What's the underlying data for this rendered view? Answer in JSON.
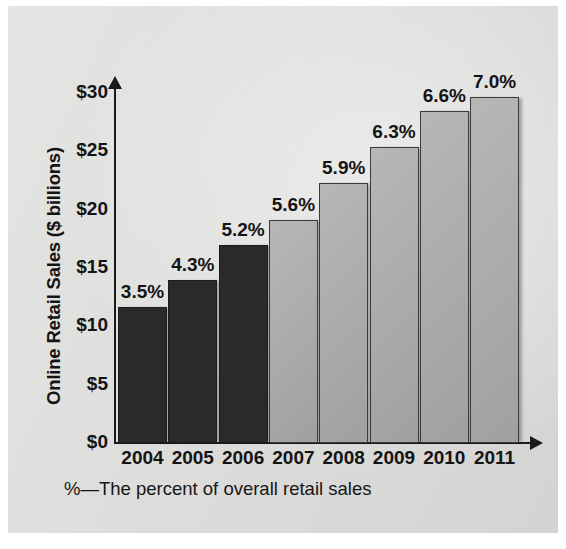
{
  "chart_data": {
    "type": "bar",
    "title": "",
    "xlabel": "",
    "ylabel": "Online Retail Sales ($ billions)",
    "categories": [
      "2004",
      "2005",
      "2006",
      "2007",
      "2008",
      "2009",
      "2010",
      "2011"
    ],
    "values": [
      11.7,
      14.0,
      17.0,
      19.1,
      22.3,
      25.4,
      28.5,
      29.7
    ],
    "point_labels": [
      "3.5%",
      "4.3%",
      "5.2%",
      "5.6%",
      "5.9%",
      "6.3%",
      "6.6%",
      "7.0%"
    ],
    "series": [
      {
        "name": "Online Retail Sales ($ billions)",
        "values": [
          11.7,
          14.0,
          17.0,
          19.1,
          22.3,
          25.4,
          28.5,
          29.7
        ]
      }
    ],
    "ylim": [
      0,
      30
    ],
    "ytick_labels": [
      "$0",
      "$5",
      "$10",
      "$15",
      "$20",
      "$25",
      "$30"
    ],
    "ytick_values": [
      0,
      5,
      10,
      15,
      20,
      25,
      30
    ],
    "grid": false,
    "legend": "none",
    "footnote": "%—The percent of overall retail sales",
    "bar_colors": [
      "#2a2a2a",
      "#2a2a2a",
      "#2a2a2a",
      "#a9a9a7",
      "#a9a9a7",
      "#a9a9a7",
      "#a9a9a7",
      "#a9a9a7"
    ],
    "colors": {
      "dark_bar": "#2a2a2a",
      "light_bar": "#a9a9a7",
      "axis": "#1a1a1a",
      "text": "#141414",
      "panel_background": "#dcdcda",
      "page_background": "#ffffff"
    }
  },
  "axis": {
    "y_title": "Online Retail Sales ($ billions)",
    "y_ticks": [
      {
        "label": "$30",
        "value": 30
      },
      {
        "label": "$25",
        "value": 25
      },
      {
        "label": "$20",
        "value": 20
      },
      {
        "label": "$15",
        "value": 15
      },
      {
        "label": "$10",
        "value": 10
      },
      {
        "label": "$5",
        "value": 5
      },
      {
        "label": "$0",
        "value": 0
      }
    ],
    "x_ticks": [
      "2004",
      "2005",
      "2006",
      "2007",
      "2008",
      "2009",
      "2010",
      "2011"
    ]
  },
  "bars": [
    {
      "year": "2004",
      "value": 11.7,
      "label": "3.5%",
      "tone": "dark"
    },
    {
      "year": "2005",
      "value": 14.0,
      "label": "4.3%",
      "tone": "dark"
    },
    {
      "year": "2006",
      "value": 17.0,
      "label": "5.2%",
      "tone": "dark"
    },
    {
      "year": "2007",
      "value": 19.1,
      "label": "5.6%",
      "tone": "light"
    },
    {
      "year": "2008",
      "value": 22.3,
      "label": "5.9%",
      "tone": "light"
    },
    {
      "year": "2009",
      "value": 25.4,
      "label": "6.3%",
      "tone": "light"
    },
    {
      "year": "2010",
      "value": 28.5,
      "label": "6.6%",
      "tone": "light"
    },
    {
      "year": "2011",
      "value": 29.7,
      "label": "7.0%",
      "tone": "light"
    }
  ],
  "footnote": "%—The percent of overall retail sales"
}
